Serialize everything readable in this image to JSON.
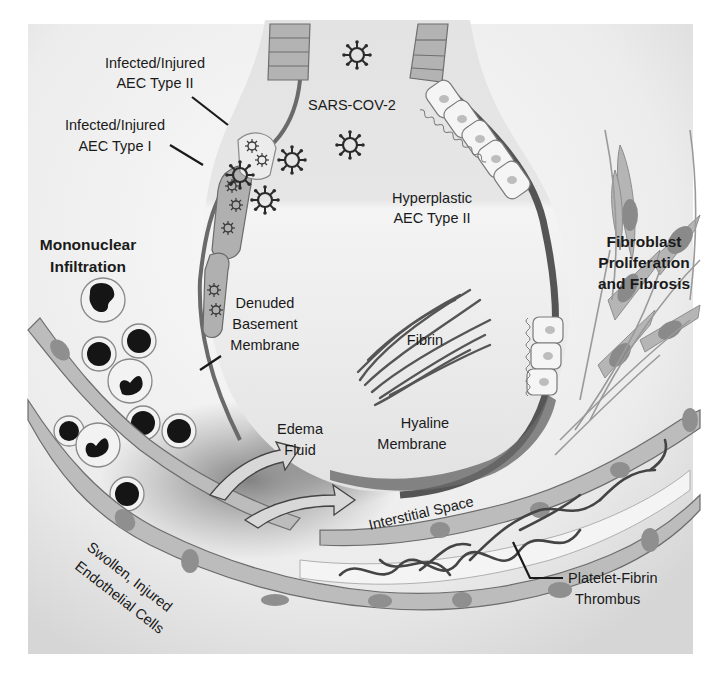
{
  "figure": {
    "style": "grayscale medical illustration"
  },
  "labels": {
    "virus": "SARS-COV-2",
    "aec2_injured_line1": "Infected/Injured",
    "aec2_injured_line2": "AEC Type II",
    "aec1_injured_line1": "Infected/Injured",
    "aec1_injured_line2": "AEC Type I",
    "hyperplastic_line1": "Hyperplastic",
    "hyperplastic_line2": "AEC Type II",
    "mononuclear_line1": "Mononuclear",
    "mononuclear_line2": "Infiltration",
    "fibroblast_line1": "Fibroblast",
    "fibroblast_line2": "Proliferation",
    "fibroblast_line3": "and Fibrosis",
    "denuded_line1": "Denuded",
    "denuded_line2": "Basement",
    "denuded_line3": "Membrane",
    "fibrin": "Fibrin",
    "edema_line1": "Edema",
    "edema_line2": "Fluid",
    "hyaline_line1": "Hyaline",
    "hyaline_line2": "Membrane",
    "interstitial": "Interstitial Space",
    "endothelial_line1": "Swollen, Injured",
    "endothelial_line2": "Endothelial Cells",
    "thrombus_line1": "Platelet-Fibrin",
    "thrombus_line2": "Thrombus"
  },
  "colors": {
    "background_frame": "#e4e4e4",
    "alveolus_fill": "#e9e9e9",
    "cell_fill": "#bdbdbd",
    "cell_stroke": "#6e6e6e",
    "nucleus": "#8f8f8f",
    "dark": "#1f1f1f",
    "membrane": "#5e5e5e",
    "edema": "#8a8a8a"
  }
}
